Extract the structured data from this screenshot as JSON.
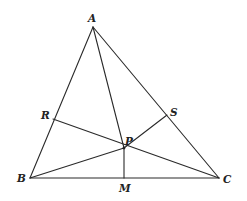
{
  "diagram": {
    "type": "geometry-triangle",
    "points": {
      "A": {
        "label": "A",
        "x": 93,
        "y": 27,
        "lx": 88,
        "ly": 22
      },
      "B": {
        "label": "B",
        "x": 30,
        "y": 178,
        "lx": 17,
        "ly": 182
      },
      "C": {
        "label": "C",
        "x": 219,
        "y": 178,
        "lx": 223,
        "ly": 183
      },
      "R": {
        "label": "R",
        "x": 53,
        "y": 119,
        "lx": 41,
        "ly": 119
      },
      "S": {
        "label": "S",
        "x": 167,
        "y": 115,
        "lx": 170,
        "ly": 116
      },
      "P": {
        "label": "P",
        "x": 124,
        "y": 148,
        "lx": 125,
        "ly": 145
      },
      "M": {
        "label": "M",
        "x": 124,
        "y": 178,
        "lx": 119,
        "ly": 192
      }
    },
    "segments": [
      {
        "from": "A",
        "to": "B",
        "name": "side-ab"
      },
      {
        "from": "A",
        "to": "C",
        "name": "side-ac"
      },
      {
        "from": "B",
        "to": "C",
        "name": "side-bc"
      },
      {
        "from": "A",
        "to": "P",
        "name": "segment-ap"
      },
      {
        "from": "R",
        "to": "C",
        "name": "segment-rc"
      },
      {
        "from": "B",
        "to": "P",
        "name": "segment-bp"
      },
      {
        "from": "P",
        "to": "S",
        "name": "segment-ps"
      },
      {
        "from": "P",
        "to": "M",
        "name": "segment-pm"
      }
    ],
    "colors": {
      "line": "#2a2a2a",
      "label": "#222222",
      "background": "#ffffff"
    }
  }
}
